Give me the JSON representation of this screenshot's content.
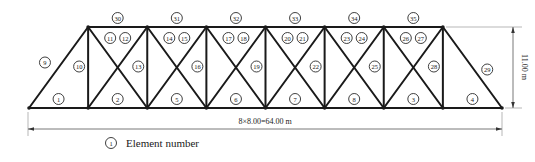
{
  "diagram": {
    "type": "truss-elevation",
    "panels": 8,
    "panel_length_m": 8.0,
    "span_label": "8×8.00=64.00 m",
    "height_label": "11.00 m",
    "bottom_chord_labels": [
      "1",
      "2",
      "5",
      "6",
      "7",
      "8",
      "3",
      "4"
    ],
    "top_chord_labels": [
      "30",
      "31",
      "32",
      "33",
      "34",
      "35"
    ],
    "end_diagonal_labels": {
      "left": "9",
      "right": "29"
    },
    "vertical_labels": [
      "10",
      "13",
      "16",
      "19",
      "22",
      "25",
      "28"
    ],
    "cross_diagonal_labels": [
      [
        "11",
        "12"
      ],
      [
        "14",
        "15"
      ],
      [
        "17",
        "18"
      ],
      [
        "20",
        "21"
      ],
      [
        "23",
        "24"
      ],
      [
        "26",
        "27"
      ]
    ],
    "legend": {
      "symbol_label": "1",
      "text": "Element number"
    }
  }
}
